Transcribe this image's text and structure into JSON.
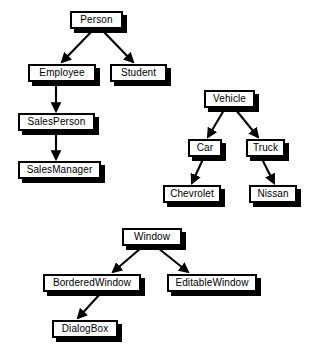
{
  "diagram": {
    "type": "class-inheritance-hierarchy",
    "background_color": "#ffffff",
    "node_fill_color": "#ffffff",
    "node_border_color": "#000000",
    "node_shadow_color": "#000000",
    "edge_color": "#000000",
    "trees": [
      {
        "name": "person-hierarchy",
        "root": "Person",
        "nodes": [
          {
            "id": "person",
            "label": "Person",
            "x": 70,
            "y": 11,
            "w": 53,
            "h": 18
          },
          {
            "id": "employee",
            "label": "Employee",
            "x": 28,
            "y": 64,
            "w": 68,
            "h": 18
          },
          {
            "id": "student",
            "label": "Student",
            "x": 110,
            "y": 64,
            "w": 57,
            "h": 18
          },
          {
            "id": "salesperson",
            "label": "SalesPerson",
            "x": 18,
            "y": 113,
            "w": 77,
            "h": 18
          },
          {
            "id": "salesmanager",
            "label": "SalesManager",
            "x": 18,
            "y": 161,
            "w": 83,
            "h": 18
          }
        ],
        "edges": [
          {
            "from": "person",
            "to": "employee",
            "x1": 93,
            "y1": 30,
            "x2": 62,
            "y2": 62
          },
          {
            "from": "person",
            "to": "student",
            "x1": 102,
            "y1": 30,
            "x2": 133,
            "y2": 62
          },
          {
            "from": "employee",
            "to": "salesperson",
            "x1": 56,
            "y1": 84,
            "x2": 56,
            "y2": 111
          },
          {
            "from": "salesperson",
            "to": "salesmanager",
            "x1": 56,
            "y1": 133,
            "x2": 56,
            "y2": 159
          }
        ]
      },
      {
        "name": "vehicle-hierarchy",
        "root": "Vehicle",
        "nodes": [
          {
            "id": "vehicle",
            "label": "Vehicle",
            "x": 204,
            "y": 90,
            "w": 51,
            "h": 18
          },
          {
            "id": "car",
            "label": "Car",
            "x": 188,
            "y": 139,
            "w": 34,
            "h": 18
          },
          {
            "id": "truck",
            "label": "Truck",
            "x": 246,
            "y": 139,
            "w": 39,
            "h": 18
          },
          {
            "id": "chevrolet",
            "label": "Chevrolet",
            "x": 163,
            "y": 185,
            "w": 58,
            "h": 18
          },
          {
            "id": "nissan",
            "label": "Nissan",
            "x": 249,
            "y": 185,
            "w": 48,
            "h": 18
          }
        ],
        "edges": [
          {
            "from": "vehicle",
            "to": "car",
            "x1": 224,
            "y1": 110,
            "x2": 208,
            "y2": 137
          },
          {
            "from": "vehicle",
            "to": "truck",
            "x1": 236,
            "y1": 110,
            "x2": 258,
            "y2": 137
          },
          {
            "from": "car",
            "to": "chevrolet",
            "x1": 203,
            "y1": 159,
            "x2": 192,
            "y2": 183
          },
          {
            "from": "truck",
            "to": "nissan",
            "x1": 262,
            "y1": 159,
            "x2": 274,
            "y2": 183
          }
        ]
      },
      {
        "name": "window-hierarchy",
        "root": "Window",
        "nodes": [
          {
            "id": "window",
            "label": "Window",
            "x": 122,
            "y": 228,
            "w": 60,
            "h": 18
          },
          {
            "id": "borderedwindow",
            "label": "BorderedWindow",
            "x": 43,
            "y": 274,
            "w": 98,
            "h": 18
          },
          {
            "id": "editablewindow",
            "label": "EditableWindow",
            "x": 167,
            "y": 274,
            "w": 90,
            "h": 18
          },
          {
            "id": "dialogbox",
            "label": "DialogBox",
            "x": 52,
            "y": 320,
            "w": 66,
            "h": 18
          }
        ],
        "edges": [
          {
            "from": "window",
            "to": "borderedwindow",
            "x1": 141,
            "y1": 248,
            "x2": 113,
            "y2": 272
          },
          {
            "from": "window",
            "to": "editablewindow",
            "x1": 158,
            "y1": 248,
            "x2": 188,
            "y2": 272
          },
          {
            "from": "borderedwindow",
            "to": "dialogbox",
            "x1": 100,
            "y1": 294,
            "x2": 78,
            "y2": 318
          }
        ]
      }
    ]
  }
}
